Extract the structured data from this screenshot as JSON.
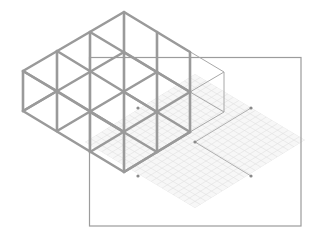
{
  "diagram": {
    "type": "isometric-grid-illustration",
    "colors": {
      "background": "#ffffff",
      "thick_grid": "#9a9a9a",
      "outline": "#9c9c9c",
      "thin_box": "#a8a8a8",
      "faint_grid": "#e2e2e2",
      "dot": "#8a8a8a",
      "bracket": "#b0b0b0"
    },
    "frame": {
      "x": 89,
      "y": 57,
      "width": 212,
      "height": 169
    },
    "thick_grid": {
      "columns_x": [
        23,
        57,
        90,
        124,
        157,
        190
      ],
      "top_vertex": [
        124,
        12
      ],
      "bottom_vertex": [
        124,
        172
      ],
      "cell_height": 40,
      "slope": 0.588
    },
    "thin_box": {
      "points": [
        [
          157,
          32
        ],
        [
          224,
          72
        ],
        [
          224,
          112
        ],
        [
          190,
          132
        ]
      ]
    },
    "faint_grid": {
      "top": [
        195,
        74
      ],
      "right": [
        305,
        140
      ],
      "bottom": [
        195,
        208
      ],
      "left": [
        85,
        142
      ]
    },
    "dots": [
      [
        138,
        108
      ],
      [
        251,
        108
      ],
      [
        138,
        176
      ],
      [
        251,
        176
      ],
      [
        195,
        142
      ]
    ],
    "bracket": [
      [
        251,
        108
      ],
      [
        195,
        142
      ],
      [
        251,
        176
      ]
    ]
  }
}
